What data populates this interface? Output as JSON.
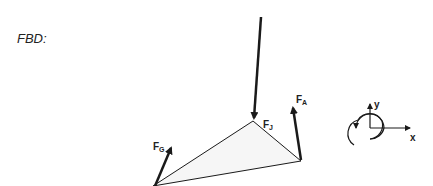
{
  "diagram": {
    "title": "FBD:",
    "forces": [
      {
        "name": "F_J",
        "main": "F",
        "sub": "J"
      },
      {
        "name": "F_A",
        "main": "F",
        "sub": "A"
      },
      {
        "name": "F_G",
        "main": "F",
        "sub": "G"
      }
    ],
    "axes": {
      "x_label": "x",
      "y_label": "y"
    },
    "colors": {
      "stroke": "#1a1a1a",
      "fill": "#f4f4f4"
    }
  }
}
